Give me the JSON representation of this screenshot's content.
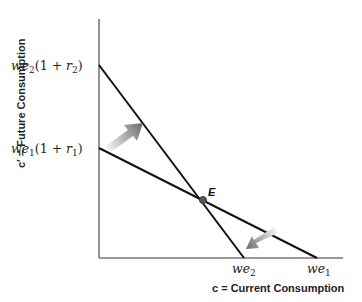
{
  "diagram": {
    "x_axis": {
      "label": "c = Current Consumption",
      "ticks": [
        {
          "label_main": "we",
          "label_sub": "2",
          "x": 244
        },
        {
          "label_main": "we",
          "label_sub": "1",
          "x": 317
        }
      ]
    },
    "y_axis": {
      "label": "c′ = Future Consumption",
      "ticks": [
        {
          "label_main": "we",
          "label_sub": "2",
          "label_paren": "(1 + ",
          "label_r": "r",
          "label_rsub": "2",
          "label_close": ")",
          "y": 65
        },
        {
          "label_main": "we",
          "label_sub": "1",
          "label_paren": "(1 + ",
          "label_r": "r",
          "label_rsub": "1",
          "label_close": ")",
          "y": 148
        }
      ]
    },
    "lines": [
      {
        "name": "budget-line-1",
        "x1": 99,
        "y1": 148,
        "x2": 317,
        "y2": 258
      },
      {
        "name": "budget-line-2",
        "x1": 99,
        "y1": 65,
        "x2": 244,
        "y2": 258
      }
    ],
    "point": {
      "label": "E",
      "x": 203,
      "y": 200
    },
    "arrows": [
      {
        "name": "arrow-up-shift",
        "direction": "up-right"
      },
      {
        "name": "arrow-down-shift",
        "direction": "down-left"
      }
    ],
    "colors": {
      "line": "#111111",
      "axis": "#777777",
      "point": "#555555",
      "arrow_dark": "#6e6e6e",
      "arrow_light": "#f2f2f2"
    }
  }
}
